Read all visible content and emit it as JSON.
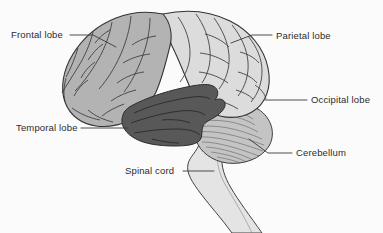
{
  "figure": {
    "background_color": "#fbfbfb",
    "outline_color": "#3a3a3a",
    "text_color": "#2b2b2b"
  },
  "regions": {
    "frontal_lobe": {
      "label": "Frontal lobe",
      "fill": "#b3b3b3"
    },
    "parietal_lobe": {
      "label": "Parietal lobe",
      "fill": "#dcdcdc"
    },
    "occipital_lobe": {
      "label": "Occipital lobe",
      "fill": "#dcdcdc"
    },
    "temporal_lobe": {
      "label": "Temporal lobe",
      "fill": "#585858"
    },
    "cerebellum": {
      "label": "Cerebellum",
      "fill": "#c4c4c4"
    },
    "spinal_cord": {
      "label": "Spinal cord",
      "fill": "#e4e4e4"
    }
  },
  "labels": [
    {
      "id": "frontal",
      "text": "Frontal lobe",
      "side": "left"
    },
    {
      "id": "parietal",
      "text": "Parietal lobe",
      "side": "right"
    },
    {
      "id": "occipital",
      "text": "Occipital lobe",
      "side": "right"
    },
    {
      "id": "temporal",
      "text": "Temporal lobe",
      "side": "left"
    },
    {
      "id": "cerebellum",
      "text": "Cerebellum",
      "side": "right"
    },
    {
      "id": "spinal",
      "text": "Spinal cord",
      "side": "left"
    }
  ]
}
